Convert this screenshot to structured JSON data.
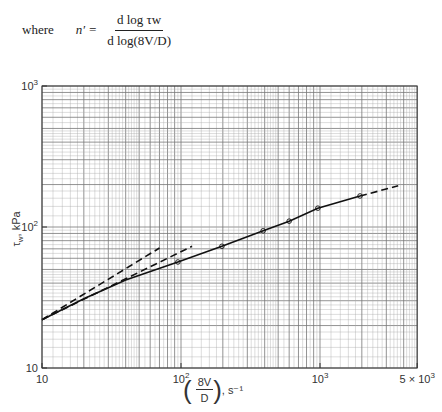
{
  "formula": {
    "where": "where",
    "lhs": "n′ =",
    "numerator": "d log τw",
    "denominator": "d log(8V/D)"
  },
  "chart_data": {
    "type": "line",
    "title": "",
    "xlabel": "(8V/D), s⁻¹",
    "ylabel": "τw, kPa",
    "xscale": "log",
    "yscale": "log",
    "xlim": [
      10,
      5000
    ],
    "ylim": [
      10,
      1000
    ],
    "grid": true,
    "x_tick_labels": [
      "10",
      "10²",
      "10³",
      "5 × 10³"
    ],
    "x_ticks": [
      10,
      100,
      1000,
      5000
    ],
    "y_tick_labels": [
      "10",
      "10²",
      "10³"
    ],
    "y_ticks": [
      10,
      100,
      1000
    ],
    "series": [
      {
        "name": "solid curve (data)",
        "style": "solid",
        "markers": true,
        "x": [
          10,
          20,
          40,
          95,
          197,
          390,
          600,
          965,
          1940
        ],
        "y": [
          22,
          31,
          42,
          56.5,
          73,
          94,
          110,
          136,
          166
        ]
      },
      {
        "name": "dashed extension",
        "style": "dashed",
        "x": [
          1940,
          3650
        ],
        "y": [
          166,
          196
        ]
      },
      {
        "name": "upper dashed line",
        "style": "dashed",
        "x": [
          10,
          70
        ],
        "y": [
          22,
          71
        ]
      },
      {
        "name": "lower dashed line",
        "style": "dashed",
        "x": [
          10,
          120
        ],
        "y": [
          22,
          73
        ]
      }
    ],
    "marker_points": {
      "x": [
        95,
        197,
        390,
        600,
        965,
        1940
      ],
      "y": [
        56.5,
        73,
        94,
        110,
        136,
        166
      ]
    }
  },
  "axes": {
    "x_label_frac_num": "8V",
    "x_label_frac_den": "D",
    "x_label_units": ", s⁻¹",
    "y_label": "τw, kPa",
    "y_label_main": "τ",
    "y_label_sub": "w",
    "y_label_units": ", kPa"
  },
  "plot_box": {
    "left": 42,
    "right": 417,
    "top": 86,
    "bottom": 368
  }
}
